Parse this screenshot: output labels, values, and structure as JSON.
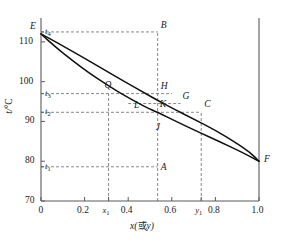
{
  "chart_data": {
    "type": "line",
    "title": "",
    "xlabel": "x(或y)",
    "ylabel": "t/°C",
    "xlim": [
      0,
      1.0
    ],
    "ylim": [
      70,
      115
    ],
    "grid": false,
    "legend": false,
    "x_ticks": [
      {
        "value": 0,
        "label": "0"
      },
      {
        "value": 0.2,
        "label": "0.2"
      },
      {
        "value": 0.31,
        "label": "x₁"
      },
      {
        "value": 0.4,
        "label": "0.4"
      },
      {
        "value": 0.6,
        "label": "0.6"
      },
      {
        "value": 0.735,
        "label": "y₁"
      },
      {
        "value": 0.8,
        "label": "0.8"
      },
      {
        "value": 1.0,
        "label": "1.0"
      }
    ],
    "y_ticks": [
      {
        "value": 70,
        "label": "70"
      },
      {
        "value": 80,
        "label": "80"
      },
      {
        "value": 90,
        "label": "90"
      },
      {
        "value": 100,
        "label": "100"
      },
      {
        "value": 110,
        "label": "110"
      }
    ],
    "y_minor_ticks": [
      {
        "value": 112.5,
        "label": "t₄"
      },
      {
        "value": 97.0,
        "label": "t₃"
      },
      {
        "value": 92.3,
        "label": "t₂"
      },
      {
        "value": 78.6,
        "label": "t₁"
      }
    ],
    "series": [
      {
        "name": "vapour-line",
        "points": [
          [
            0,
            112
          ],
          [
            0.08,
            109.6
          ],
          [
            0.18,
            106.5
          ],
          [
            0.28,
            103.3
          ],
          [
            0.38,
            100.1
          ],
          [
            0.48,
            97.0
          ],
          [
            0.535,
            95.3
          ],
          [
            0.6,
            93.4
          ],
          [
            0.7,
            90.6
          ],
          [
            0.8,
            87.8
          ],
          [
            0.9,
            84.4
          ],
          [
            0.96,
            82.2
          ],
          [
            1.0,
            80
          ]
        ]
      },
      {
        "name": "liquid-line",
        "points": [
          [
            0,
            112
          ],
          [
            0.06,
            109.0
          ],
          [
            0.14,
            105.5
          ],
          [
            0.22,
            102.2
          ],
          [
            0.31,
            98.9
          ],
          [
            0.4,
            96.0
          ],
          [
            0.48,
            93.6
          ],
          [
            0.535,
            92.3
          ],
          [
            0.62,
            90.0
          ],
          [
            0.72,
            87.4
          ],
          [
            0.82,
            84.9
          ],
          [
            0.92,
            82.3
          ],
          [
            1.0,
            80
          ]
        ]
      }
    ],
    "h_dashed_lines": [
      {
        "name": "t4-line",
        "y": 112.5,
        "x_from": 0,
        "x_to": 0.535
      },
      {
        "name": "t3-line",
        "y": 97.0,
        "x_from": 0,
        "x_to": 0.6
      },
      {
        "name": "t2-line",
        "y": 92.3,
        "x_from": 0,
        "x_to": 0.735
      },
      {
        "name": "t1-line",
        "y": 78.6,
        "x_from": 0,
        "x_to": 0.535
      },
      {
        "name": "KG-line",
        "y": 94.5,
        "x_from": 0.4,
        "x_to": 0.64
      }
    ],
    "v_dashed_lines": [
      {
        "name": "x1-line",
        "x": 0.31,
        "y_from": 70,
        "y_to": 97.0
      },
      {
        "name": "mid-line",
        "x": 0.535,
        "y_from": 70,
        "y_to": 112.5
      },
      {
        "name": "y1-line",
        "x": 0.735,
        "y_from": 70,
        "y_to": 92.3
      }
    ],
    "annotations": [
      {
        "name": "E",
        "label": "E",
        "x": 0.0,
        "y": 112.0
      },
      {
        "name": "B",
        "label": "B",
        "x": 0.535,
        "y": 112.5
      },
      {
        "name": "Q",
        "label": "Q",
        "x": 0.31,
        "y": 97.0
      },
      {
        "name": "H",
        "label": "H",
        "x": 0.535,
        "y": 97.0
      },
      {
        "name": "G",
        "label": "G",
        "x": 0.64,
        "y": 94.5
      },
      {
        "name": "C",
        "label": "C",
        "x": 0.735,
        "y": 92.3
      },
      {
        "name": "L",
        "label": "L",
        "x": 0.44,
        "y": 92.3
      },
      {
        "name": "K",
        "label": "K",
        "x": 0.535,
        "y": 92.3
      },
      {
        "name": "J",
        "label": "J",
        "x": 0.535,
        "y": 90.0
      },
      {
        "name": "A",
        "label": "A",
        "x": 0.535,
        "y": 78.6
      },
      {
        "name": "F",
        "label": "F",
        "x": 1.0,
        "y": 80.0
      }
    ],
    "colors": {
      "axis": "#5a5a5a",
      "curve": "#111111",
      "dashed": "#6b6b6b",
      "text": "#1a1a1a"
    }
  }
}
